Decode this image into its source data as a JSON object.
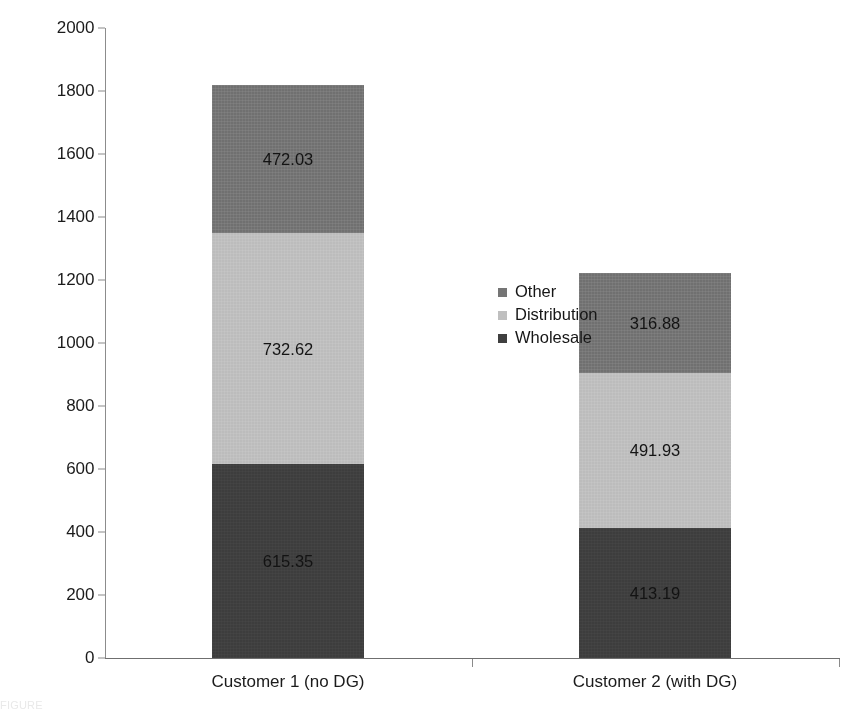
{
  "chart_data": {
    "type": "bar",
    "subtype": "stacked-bar",
    "title": "",
    "xlabel": "",
    "ylabel": "Electricity bill (per annum)",
    "categories": [
      "Customer 1 (no DG)",
      "Customer 2 (with DG)"
    ],
    "series": [
      {
        "name": "Wholesale",
        "values": [
          615.35,
          413.19
        ],
        "color": "#3f3f3f"
      },
      {
        "name": "Distribution",
        "values": [
          732.62,
          491.93
        ],
        "color": "#bfbfbf"
      },
      {
        "name": "Other",
        "values": [
          472.03,
          316.88
        ],
        "color": "#757575"
      }
    ],
    "stack_order_bottom_to_top": [
      "Wholesale",
      "Distribution",
      "Other"
    ],
    "totals": [
      1820.0,
      1222.0
    ],
    "ylim": [
      0,
      2000
    ],
    "yticks": [
      0,
      200,
      400,
      600,
      800,
      1000,
      1200,
      1400,
      1600,
      1800,
      2000
    ],
    "ytick_labels": [
      "0",
      "200",
      "400",
      "600",
      "800",
      "1000",
      "1200",
      "1400",
      "1600",
      "1800",
      "2000"
    ],
    "grid": false,
    "legend_position": "center",
    "data_labels": {
      "customer_1": {
        "other": "472.03",
        "distribution": "732.62",
        "wholesale": "615.35"
      },
      "customer_2": {
        "other": "316.88",
        "distribution": "491.93",
        "wholesale": "413.19"
      }
    }
  },
  "axis": {
    "y_title": "Electricity bill (per annum)",
    "y_min": 0,
    "y_max": 2000,
    "ticks": [
      "2000",
      "1800",
      "1600",
      "1400",
      "1200",
      "1000",
      "800",
      "600",
      "400",
      "200",
      "0"
    ]
  },
  "legend": {
    "items": [
      {
        "label": "Other",
        "color": "#757575"
      },
      {
        "label": "Distribution",
        "color": "#bfbfbf"
      },
      {
        "label": "Wholesale",
        "color": "#3f3f3f"
      }
    ]
  },
  "xaxis": {
    "labels": [
      "Customer 1 (no DG)",
      "Customer 2 (with DG)"
    ]
  },
  "bars": [
    {
      "category": "Customer 1 (no DG)",
      "segments": [
        {
          "name": "Other",
          "label": "472.03",
          "value": 472.03,
          "color": "#757575"
        },
        {
          "name": "Distribution",
          "label": "732.62",
          "value": 732.62,
          "color": "#bfbfbf"
        },
        {
          "name": "Wholesale",
          "label": "615.35",
          "value": 615.35,
          "color": "#3f3f3f"
        }
      ]
    },
    {
      "category": "Customer 2 (with DG)",
      "segments": [
        {
          "name": "Other",
          "label": "316.88",
          "value": 316.88,
          "color": "#757575"
        },
        {
          "name": "Distribution",
          "label": "491.93",
          "value": 491.93,
          "color": "#bfbfbf"
        },
        {
          "name": "Wholesale",
          "label": "413.19",
          "value": 413.19,
          "color": "#3f3f3f"
        }
      ]
    }
  ],
  "caption": {
    "text": "FIGURE"
  }
}
